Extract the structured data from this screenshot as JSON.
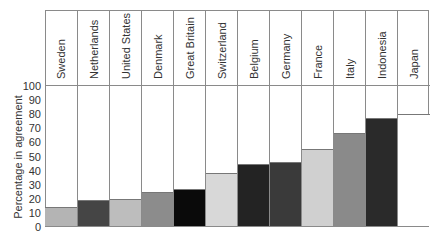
{
  "chart_data": {
    "type": "bar",
    "title": "",
    "xlabel": "",
    "ylabel": "Percentage in agreement",
    "ylim": [
      0,
      100
    ],
    "yticks": [
      0,
      10,
      20,
      30,
      40,
      50,
      60,
      70,
      80,
      90,
      100
    ],
    "grid": false,
    "legend": null,
    "categories": [
      "Sweden",
      "Netherlands",
      "United States",
      "Denmark",
      "Great Britain",
      "Switzerland",
      "Belgium",
      "Germany",
      "France",
      "Italy",
      "Indonesia",
      "Japan"
    ],
    "values": [
      14,
      19,
      20,
      25,
      27,
      38,
      45,
      46,
      55,
      67,
      77,
      80
    ],
    "bar_colors": [
      "#b4b4b4",
      "#454545",
      "#bdbdbd",
      "#8c8c8c",
      "#0a0a0a",
      "#d8d8d8",
      "#232323",
      "#3a3a3a",
      "#d0d0d0",
      "#8a8a8a",
      "#2a2a2a",
      "#ffffff"
    ]
  },
  "axis": {
    "ylabel": "Percentage in agreement",
    "ticks": [
      "0",
      "10",
      "20",
      "30",
      "40",
      "50",
      "60",
      "70",
      "80",
      "90",
      "100"
    ]
  },
  "columns": [
    {
      "label": "Sweden"
    },
    {
      "label": "Netherlands"
    },
    {
      "label": "United States"
    },
    {
      "label": "Denmark"
    },
    {
      "label": "Great Britain"
    },
    {
      "label": "Switzerland"
    },
    {
      "label": "Belgium"
    },
    {
      "label": "Germany"
    },
    {
      "label": "France"
    },
    {
      "label": "Italy"
    },
    {
      "label": "Indonesia"
    },
    {
      "label": "Japan"
    }
  ]
}
